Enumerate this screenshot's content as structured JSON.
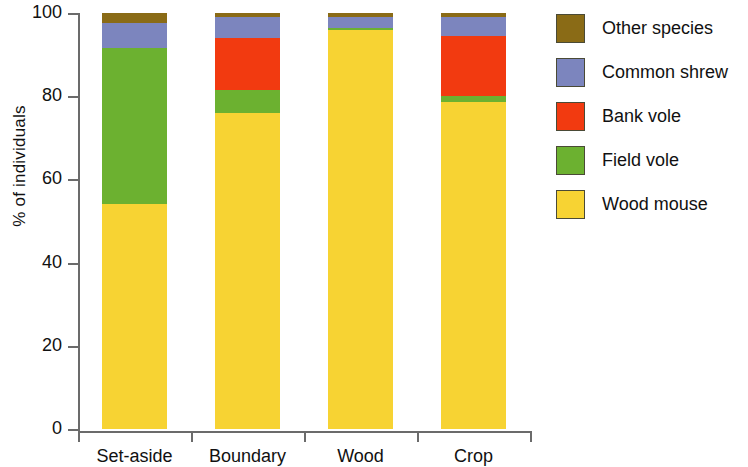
{
  "chart_data": {
    "type": "bar",
    "subtype": "stacked-bar-100-percent",
    "title": "",
    "subtitle": "",
    "xlabel": "",
    "ylabel": "% of individuals",
    "categories": [
      "Set-aside",
      "Boundary",
      "Wood",
      "Crop"
    ],
    "ylim": [
      0,
      100
    ],
    "yticks": [
      0,
      20,
      40,
      60,
      80,
      100
    ],
    "ytick_labels": [
      "0",
      "20",
      "40",
      "60",
      "80",
      "100"
    ],
    "grid": false,
    "legend_position": "right",
    "stack_order_bottom_to_top": [
      "Wood mouse",
      "Field vole",
      "Bank vole",
      "Common shrew",
      "Other species"
    ],
    "series": [
      {
        "name": "Wood mouse",
        "color": "#F7D333",
        "values": [
          54.0,
          76.0,
          96.0,
          78.5
        ]
      },
      {
        "name": "Field vole",
        "color": "#6CB130",
        "values": [
          37.5,
          5.5,
          0.5,
          1.5
        ]
      },
      {
        "name": "Bank vole",
        "color": "#F23A10",
        "values": [
          0.0,
          12.5,
          0.0,
          14.5
        ]
      },
      {
        "name": "Common shrew",
        "color": "#7C85BE",
        "values": [
          6.0,
          5.0,
          2.5,
          4.5
        ]
      },
      {
        "name": "Other species",
        "color": "#8A6B16",
        "values": [
          2.5,
          1.0,
          1.0,
          1.0
        ]
      }
    ],
    "cumulative_tops": {
      "Set-aside": {
        "Wood mouse": 54.0,
        "Field vole": 91.5,
        "Bank vole": 91.5,
        "Common shrew": 97.5,
        "Other species": 100.0
      },
      "Boundary": {
        "Wood mouse": 76.0,
        "Field vole": 81.5,
        "Bank vole": 94.0,
        "Common shrew": 99.0,
        "Other species": 100.0
      },
      "Wood": {
        "Wood mouse": 96.0,
        "Field vole": 96.5,
        "Bank vole": 96.5,
        "Common shrew": 99.0,
        "Other species": 100.0
      },
      "Crop": {
        "Wood mouse": 78.5,
        "Field vole": 80.0,
        "Bank vole": 94.5,
        "Common shrew": 99.0,
        "Other species": 100.0
      }
    }
  },
  "legend": {
    "entries": [
      {
        "label": "Other species",
        "color": "#8A6B16"
      },
      {
        "label": "Common shrew",
        "color": "#7C85BE"
      },
      {
        "label": "Bank vole",
        "color": "#F23A10"
      },
      {
        "label": "Field vole",
        "color": "#6CB130"
      },
      {
        "label": "Wood mouse",
        "color": "#F7D333"
      }
    ]
  },
  "axes": {
    "y_label": "% of individuals",
    "y_tick_labels": [
      "100",
      "80",
      "60",
      "40",
      "20",
      "0"
    ],
    "x_tick_labels": [
      "Set-aside",
      "Boundary",
      "Wood",
      "Crop"
    ]
  },
  "colors": {
    "axis": "#6b6b6b",
    "text": "#111111",
    "background": "#ffffff"
  }
}
